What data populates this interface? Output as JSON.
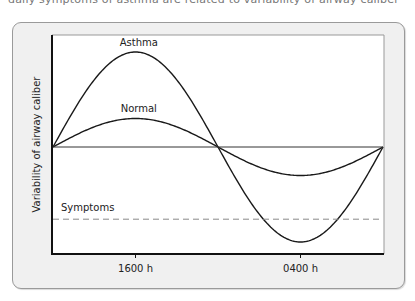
{
  "caption_fragment": "daily symptoms of asthma are related to variability of airway caliber",
  "chart_data": {
    "type": "line",
    "title": "",
    "xlabel": "",
    "ylabel": "Variability of airway caliber",
    "x_unit": "fraction of 24-h cycle",
    "x_range": [
      0,
      1
    ],
    "y_range": [
      -1.0,
      1.0
    ],
    "x_ticks": [
      {
        "pos": 0.25,
        "label": "1600 h"
      },
      {
        "pos": 0.75,
        "label": "0400 h"
      }
    ],
    "series": [
      {
        "name": "Asthma",
        "shape": "sine",
        "amplitude": 1.0,
        "label": "Asthma",
        "label_pos": [
          0.26,
          1.06
        ]
      },
      {
        "name": "Normal",
        "shape": "sine",
        "amplitude": 0.3,
        "label": "Normal",
        "label_pos": [
          0.26,
          0.37
        ]
      },
      {
        "name": "Baseline",
        "shape": "flat",
        "value": 0
      }
    ],
    "threshold": {
      "name": "Symptoms",
      "label": "Symptoms",
      "value": -0.76,
      "style": "dashed"
    },
    "grid": false,
    "legend": "none"
  },
  "colors": {
    "curve": "#1a1a1a",
    "baseline": "#333333",
    "threshold": "#888888",
    "frame": "#999999",
    "axis": "#111111"
  }
}
